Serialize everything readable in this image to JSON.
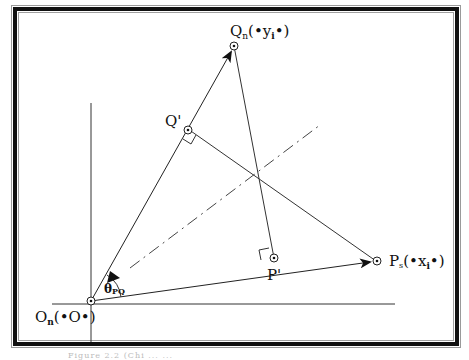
{
  "figure": {
    "points": {
      "origin": {
        "label": "O",
        "sub": "n",
        "coord": "(•O•)"
      },
      "q_n": {
        "label": "Q",
        "sub": "n",
        "coord": "(•y",
        "coord_sub": "i",
        "coord_end": "•)"
      },
      "p_n": {
        "label": "P",
        "sub": "s",
        "coord": "(•x",
        "coord_sub": "i",
        "coord_end": "•)"
      },
      "q_prime": {
        "label": "Q'"
      },
      "p_prime": {
        "label": "P'"
      }
    },
    "angle_label": {
      "symbol": "θ",
      "sub": "PQ"
    },
    "caption": "Figure 2.2 (Chi ... ..."
  }
}
